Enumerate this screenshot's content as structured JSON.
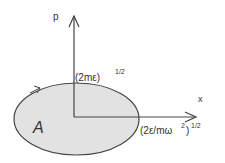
{
  "diagram": {
    "axes": {
      "vertical_label": "p",
      "horizontal_label": "x"
    },
    "labels": {
      "p_intercept": "(2mε)",
      "p_intercept_exp": "1/2",
      "x_intercept": "(2ε/mω",
      "x_intercept_sq": "2",
      "x_intercept_close": ")",
      "x_intercept_exp": "1/2",
      "area": "A"
    },
    "colors": {
      "fill": "#e2e2e2",
      "stroke": "#444444"
    }
  }
}
